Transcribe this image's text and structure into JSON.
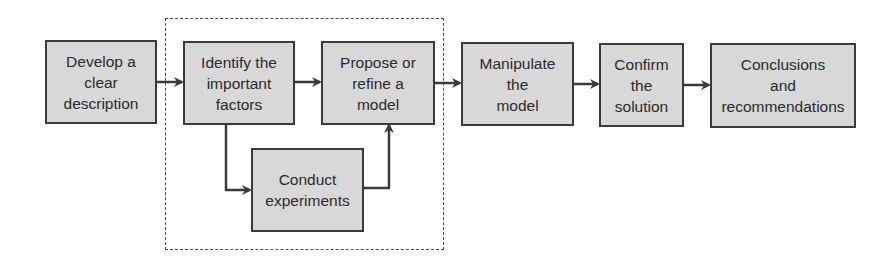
{
  "diagram": {
    "type": "flowchart",
    "colors": {
      "box_fill": "#d8d8d8",
      "box_border": "#3a3a3a",
      "text": "#2b2b2b",
      "arrow": "#3a3a3a",
      "dashed_border": "#4a4a4a"
    },
    "nodes": [
      {
        "id": "develop",
        "label": "Develop a\nclear\ndescription"
      },
      {
        "id": "identify",
        "label": "Identify the\nimportant\nfactors"
      },
      {
        "id": "propose",
        "label": "Propose or\nrefine a\nmodel"
      },
      {
        "id": "conduct",
        "label": "Conduct\nexperiments"
      },
      {
        "id": "manipulate",
        "label": "Manipulate\nthe\nmodel"
      },
      {
        "id": "confirm",
        "label": "Confirm\nthe\nsolution"
      },
      {
        "id": "conclusions",
        "label": "Conclusions\nand\nrecommendations"
      }
    ],
    "edges": [
      {
        "from": "develop",
        "to": "identify"
      },
      {
        "from": "identify",
        "to": "propose"
      },
      {
        "from": "identify",
        "to": "conduct"
      },
      {
        "from": "conduct",
        "to": "propose"
      },
      {
        "from": "propose",
        "to": "manipulate"
      },
      {
        "from": "manipulate",
        "to": "confirm"
      },
      {
        "from": "confirm",
        "to": "conclusions"
      }
    ],
    "groups": [
      {
        "id": "iterative-loop",
        "style": "dashed",
        "contains": [
          "identify",
          "propose",
          "conduct"
        ]
      }
    ]
  }
}
